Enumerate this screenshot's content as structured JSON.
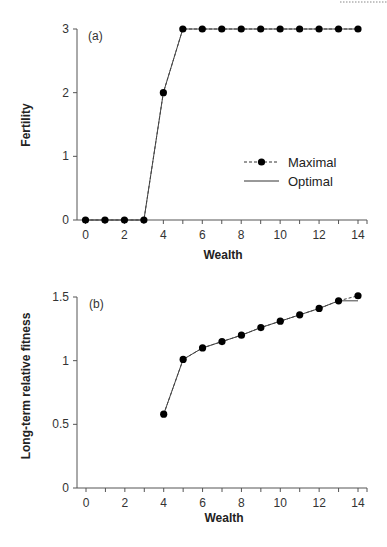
{
  "chart_data": [
    {
      "type": "line",
      "panel_label": "(a)",
      "xlabel": "Wealth",
      "ylabel": "Fertility",
      "xlim": [
        -0.5,
        14.5
      ],
      "ylim": [
        0,
        3
      ],
      "xticks": [
        0,
        2,
        4,
        6,
        8,
        10,
        12,
        14
      ],
      "yticks": [
        0,
        1,
        2,
        3
      ],
      "grid": false,
      "legend_position": "center-right",
      "x": [
        0,
        1,
        2,
        3,
        4,
        5,
        6,
        7,
        8,
        9,
        10,
        11,
        12,
        13,
        14
      ],
      "series": [
        {
          "name": "Maximal",
          "style": "dashed-with-markers",
          "x": [
            0,
            1,
            2,
            3,
            4,
            5,
            6,
            7,
            8,
            9,
            10,
            11,
            12,
            13,
            14
          ],
          "values": [
            0,
            0,
            0,
            0,
            2,
            3,
            3,
            3,
            3,
            3,
            3,
            3,
            3,
            3,
            3
          ]
        },
        {
          "name": "Optimal",
          "style": "solid",
          "x": [
            0,
            1,
            2,
            3,
            4,
            5,
            6,
            7,
            8,
            9,
            10,
            11,
            12,
            13,
            14
          ],
          "values": [
            0,
            0,
            0,
            0,
            2,
            3,
            3,
            3,
            3,
            3,
            3,
            3,
            3,
            3,
            3
          ]
        }
      ]
    },
    {
      "type": "line",
      "panel_label": "(b)",
      "xlabel": "Wealth",
      "ylabel": "Long-term relative fitness",
      "xlim": [
        -0.5,
        14.5
      ],
      "ylim": [
        0,
        1.5
      ],
      "xticks": [
        0,
        2,
        4,
        6,
        8,
        10,
        12,
        14
      ],
      "yticks": [
        0,
        0.5,
        1,
        1.5
      ],
      "grid": false,
      "series": [
        {
          "name": "Maximal",
          "style": "dashed-with-markers",
          "x": [
            4,
            5,
            6,
            7,
            8,
            9,
            10,
            11,
            12,
            13,
            14
          ],
          "values": [
            0.58,
            1.01,
            1.1,
            1.15,
            1.2,
            1.26,
            1.31,
            1.36,
            1.41,
            1.47,
            1.51
          ]
        },
        {
          "name": "Optimal",
          "style": "solid",
          "x": [
            4,
            5,
            6,
            7,
            8,
            9,
            10,
            11,
            12,
            13,
            14
          ],
          "values": [
            0.58,
            1.01,
            1.1,
            1.15,
            1.2,
            1.26,
            1.31,
            1.36,
            1.41,
            1.47,
            1.47
          ]
        }
      ]
    }
  ],
  "labels": {
    "a": {
      "panel": "(a)",
      "xlabel": "Wealth",
      "ylabel": "Fertility",
      "yticks": [
        "0",
        "1",
        "2",
        "3"
      ],
      "xticks": [
        "0",
        "2",
        "4",
        "6",
        "8",
        "10",
        "12",
        "14"
      ]
    },
    "b": {
      "panel": "(b)",
      "xlabel": "Wealth",
      "ylabel": "Long-term relative fitness",
      "yticks": [
        "0",
        "0.5",
        "1",
        "1.5"
      ],
      "xticks": [
        "0",
        "2",
        "4",
        "6",
        "8",
        "10",
        "12",
        "14"
      ]
    },
    "legend": {
      "maximal": "Maximal",
      "optimal": "Optimal"
    }
  }
}
